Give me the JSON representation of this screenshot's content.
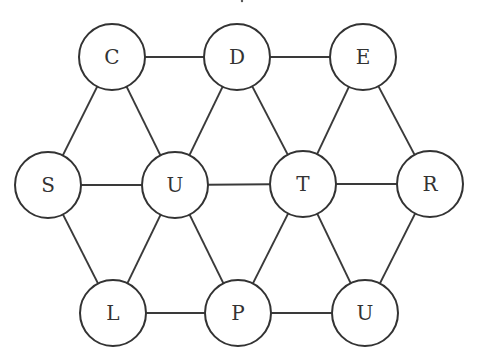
{
  "diagram": {
    "type": "graph",
    "stroke_color": "#333333",
    "node_radius": 33,
    "nodes": [
      {
        "id": "C",
        "label": "C",
        "x": 112,
        "y": 57
      },
      {
        "id": "D",
        "label": "D",
        "x": 237,
        "y": 57
      },
      {
        "id": "E",
        "label": "E",
        "x": 363,
        "y": 57
      },
      {
        "id": "S",
        "label": "S",
        "x": 48,
        "y": 185
      },
      {
        "id": "U1",
        "label": "U",
        "x": 175,
        "y": 185
      },
      {
        "id": "T",
        "label": "T",
        "x": 303,
        "y": 184
      },
      {
        "id": "R",
        "label": "R",
        "x": 430,
        "y": 184
      },
      {
        "id": "L",
        "label": "L",
        "x": 113,
        "y": 313
      },
      {
        "id": "P",
        "label": "P",
        "x": 238,
        "y": 313
      },
      {
        "id": "U2",
        "label": "U",
        "x": 365,
        "y": 313
      }
    ],
    "edges": [
      [
        "C",
        "D"
      ],
      [
        "D",
        "E"
      ],
      [
        "C",
        "S"
      ],
      [
        "C",
        "U1"
      ],
      [
        "D",
        "U1"
      ],
      [
        "D",
        "T"
      ],
      [
        "E",
        "T"
      ],
      [
        "E",
        "R"
      ],
      [
        "S",
        "U1"
      ],
      [
        "U1",
        "T"
      ],
      [
        "T",
        "R"
      ],
      [
        "S",
        "L"
      ],
      [
        "U1",
        "L"
      ],
      [
        "U1",
        "P"
      ],
      [
        "T",
        "P"
      ],
      [
        "T",
        "U2"
      ],
      [
        "R",
        "U2"
      ],
      [
        "L",
        "P"
      ],
      [
        "P",
        "U2"
      ]
    ]
  }
}
